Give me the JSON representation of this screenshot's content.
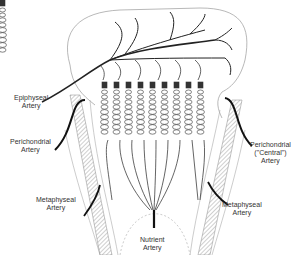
{
  "diagram": {
    "labels": {
      "epiphyseal": [
        "Epiphyseal",
        "Artery"
      ],
      "perichondrial_left": [
        "Perichondrial",
        "Artery"
      ],
      "perichondrial_right": [
        "Perichondrial",
        "(\"Central\")",
        "Artery"
      ],
      "metaphyseal_left": [
        "Metaphyseal",
        "Artery"
      ],
      "metaphyseal_right": [
        "Metaphyseal",
        "Artery"
      ],
      "nutrient": [
        "Nutrient",
        "Artery"
      ]
    },
    "colors": {
      "line": "#222222",
      "outline": "#999999",
      "hatch": "#777777",
      "text": "#333333"
    }
  }
}
